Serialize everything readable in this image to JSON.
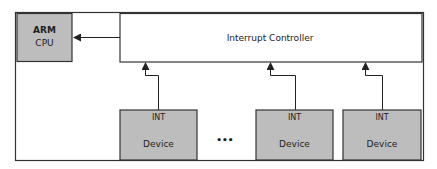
{
  "diagram": {
    "cpu": {
      "line1": "ARM",
      "line2": "CPU",
      "fill": "#bdbdbd"
    },
    "controller": {
      "label": "Interrupt Controller",
      "fill": "#ffffff"
    },
    "devices": [
      {
        "int_label": "INT",
        "label": "Device"
      },
      {
        "int_label": "INT",
        "label": "Device"
      },
      {
        "int_label": "INT",
        "label": "Device"
      }
    ],
    "ellipsis": "•••",
    "colors": {
      "stroke": "#333333",
      "box_fill": "#bdbdbd",
      "background": "#ffffff"
    }
  }
}
